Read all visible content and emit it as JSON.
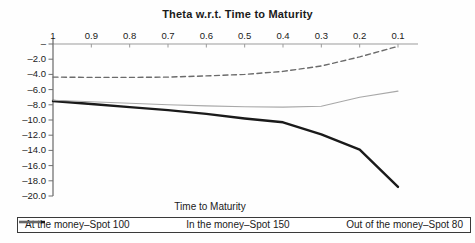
{
  "title": "Theta w.r.t. Time to Maturity",
  "bottom_axis_label": "Time to Maturity",
  "legend": [
    {
      "label": "At the money–Spot 100"
    },
    {
      "label": "In the money–Spot 150"
    },
    {
      "label": "Out of the money–Spot 80"
    }
  ],
  "chart_data": {
    "type": "line",
    "title": "Theta w.r.t. Time to Maturity",
    "xlabel": "Time to Maturity",
    "ylabel": "",
    "x_axis_position": "top",
    "x_axis_reversed": true,
    "x": [
      1,
      0.9,
      0.8,
      0.7,
      0.6,
      0.5,
      0.4,
      0.3,
      0.2,
      0.1
    ],
    "x_tick_labels": [
      "1",
      "0.9",
      "0.8",
      "0.7",
      "0.6",
      "0.5",
      "0.4",
      "0.3",
      "0.2",
      "0.1"
    ],
    "ylim": [
      -20,
      0
    ],
    "y_ticks": [
      0,
      -2,
      -4,
      -6,
      -8,
      -10,
      -12,
      -14,
      -16,
      -18,
      -20
    ],
    "y_tick_labels": [
      "–",
      "–2.0",
      "–4.0",
      "–6.0",
      "–8.0",
      "–10.0",
      "–12.0",
      "–14.0",
      "–16.0",
      "–18.0",
      "–20.0"
    ],
    "grid": false,
    "legend_position": "bottom",
    "series": [
      {
        "name": "At the money–Spot 100",
        "style": "solid-thick",
        "color": "#1a1a1a",
        "values": [
          -7.5,
          -7.9,
          -8.3,
          -8.7,
          -9.2,
          -9.8,
          -10.3,
          -11.9,
          -13.9,
          -18.8
        ]
      },
      {
        "name": "In the money–Spot 150",
        "style": "solid-thin",
        "color": "#a8a8a8",
        "values": [
          -7.4,
          -7.6,
          -7.8,
          -8.0,
          -8.15,
          -8.25,
          -8.3,
          -8.2,
          -7.0,
          -6.2
        ]
      },
      {
        "name": "Out of the money–Spot 80",
        "style": "dashed",
        "color": "#6b6b6b",
        "values": [
          -4.35,
          -4.4,
          -4.4,
          -4.35,
          -4.2,
          -4.0,
          -3.6,
          -2.9,
          -1.7,
          -0.3
        ]
      }
    ]
  }
}
